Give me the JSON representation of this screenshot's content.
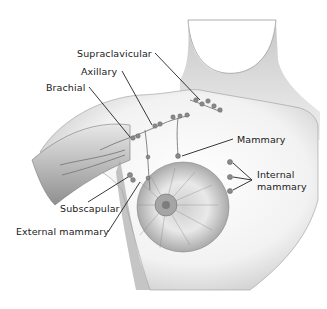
{
  "diagram": {
    "type": "anatomical-illustration",
    "labels": [
      {
        "id": "supraclavicular",
        "text": "Supraclavicular",
        "x": 77,
        "y": 48
      },
      {
        "id": "axillary",
        "text": "Axillary",
        "x": 81,
        "y": 66
      },
      {
        "id": "brachial",
        "text": "Brachial",
        "x": 46,
        "y": 82
      },
      {
        "id": "mammary",
        "text": "Mammary",
        "x": 237,
        "y": 136
      },
      {
        "id": "internal-mammary-1",
        "text": "Internal",
        "x": 257,
        "y": 170
      },
      {
        "id": "internal-mammary-2",
        "text": "mammary",
        "x": 257,
        "y": 182
      },
      {
        "id": "subscapular",
        "text": "Subscapular",
        "x": 60,
        "y": 203
      },
      {
        "id": "external-mammary",
        "text": "External mammary",
        "x": 16,
        "y": 226
      }
    ],
    "colors": {
      "background": "#ffffff",
      "text": "#1a1a1a",
      "leader_line": "#222222",
      "shading_dark": "#6e6e6e",
      "shading_light": "#d6d6d6",
      "node": "#8a8a8a"
    }
  }
}
